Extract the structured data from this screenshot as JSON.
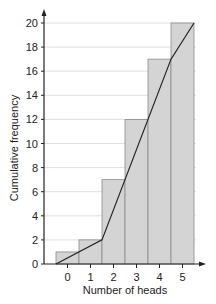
{
  "chart_data": {
    "type": "bar",
    "subtype": "cumulative-frequency-histogram-with-polygon",
    "title": "",
    "xlabel": "Number of heads",
    "ylabel": "Cumulative frequency",
    "categories": [
      "0",
      "1",
      "2",
      "3",
      "4",
      "5"
    ],
    "values": [
      1,
      2,
      7,
      12,
      17,
      20
    ],
    "series": [
      {
        "name": "Cumulative frequency (bars)",
        "values": [
          1,
          2,
          7,
          12,
          17,
          20
        ]
      },
      {
        "name": "Cumulative frequency polygon",
        "x": [
          -0.5,
          1.5,
          2.5,
          3.5,
          4.5,
          5.5
        ],
        "y": [
          0,
          2,
          7,
          12,
          17,
          20
        ]
      }
    ],
    "yticks": [
      0,
      2,
      4,
      6,
      8,
      10,
      12,
      14,
      16,
      18,
      20
    ],
    "ylim": [
      0,
      20
    ],
    "grid": true,
    "legend": null,
    "colors": {
      "bar_fill": "#d4d4d4",
      "bar_edge": "#8a8a8a",
      "line": "#222222",
      "grid": "#d8d8d8"
    }
  }
}
